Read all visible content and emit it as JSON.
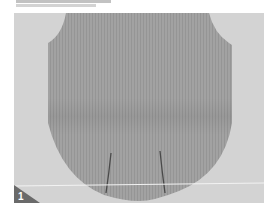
{
  "figure": {
    "caption_text": "",
    "step_number": "1",
    "colors": {
      "background": "#d3d3d3",
      "garment": "#9e9e9e",
      "badge": "#6a6a6a",
      "guide_line": "#f2f2f2"
    }
  }
}
